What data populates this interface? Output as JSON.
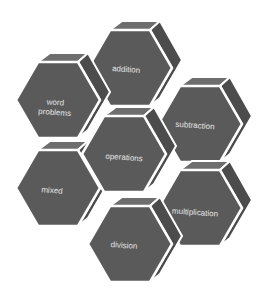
{
  "diagram": {
    "type": "hexagon-cluster",
    "colors": {
      "face": "#5a5a5a",
      "top": "#6e6e6e",
      "side": "#4c4c4c",
      "edge": "#ffffff",
      "text": "#e4e4e4"
    },
    "center": {
      "label": "operations"
    },
    "nodes": [
      {
        "id": "addition",
        "label": "addition"
      },
      {
        "id": "word-problems",
        "label_line1": "word",
        "label_line2": "problems"
      },
      {
        "id": "subtraction",
        "label": "subtraction"
      },
      {
        "id": "mixed",
        "label": "mixed"
      },
      {
        "id": "multiplication",
        "label": "multiplication"
      },
      {
        "id": "division",
        "label": "division"
      }
    ]
  }
}
